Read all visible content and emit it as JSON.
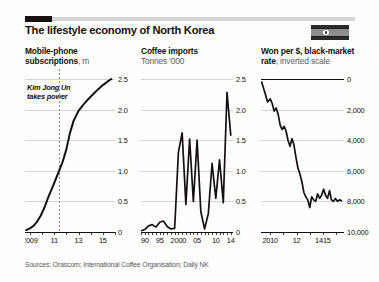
{
  "header": {
    "title": "The lifestyle economy of North Korea",
    "flag_name": "north-korea-flag"
  },
  "sources": "Sources: Orascom; International Coffee Organisation; Daily NK",
  "annotation": {
    "line1": "Kim Jong Un",
    "line2": "takes power"
  },
  "colors": {
    "ink": "#14100f",
    "grid": "#c9c9c4",
    "rule": "#d4d4d0",
    "muted": "#5c5c58",
    "line": "#16100f"
  },
  "chart_data": [
    {
      "type": "line",
      "id": "mobile-phone-subscriptions",
      "title": "Mobile-phone subscriptions",
      "title_main": "Mobile-phone",
      "title_second": "subscriptions",
      "unit": ", m",
      "ylabel": "m",
      "xlabel": "",
      "ylim": [
        0,
        2.5
      ],
      "yticks": [
        0,
        0.5,
        1.0,
        1.5,
        2.0,
        2.5
      ],
      "ytick_labels": [
        "0",
        "0.5",
        "1.0",
        "1.5",
        "2.0",
        "2.5"
      ],
      "xlim": [
        2008.6,
        2016.0
      ],
      "xticks": [
        2009,
        2010,
        2011,
        2012,
        2013,
        2014,
        2015,
        2016
      ],
      "xtick_labels": [
        "2009",
        "11",
        "13",
        "15"
      ],
      "xtick_label_values": [
        2009,
        2011,
        2013,
        2015
      ],
      "grid": true,
      "annotation_x": 2011.4,
      "annotation": "Kim Jong Un takes power",
      "x": [
        2008.7,
        2009.0,
        2009.3,
        2009.6,
        2009.9,
        2010.2,
        2010.5,
        2010.9,
        2011.3,
        2011.7,
        2012.0,
        2012.3,
        2012.6,
        2013.0,
        2013.4,
        2013.8,
        2014.2,
        2014.6,
        2015.0,
        2015.4,
        2015.7
      ],
      "values": [
        0.03,
        0.06,
        0.1,
        0.17,
        0.27,
        0.4,
        0.56,
        0.75,
        0.95,
        1.15,
        1.35,
        1.62,
        1.82,
        1.98,
        2.08,
        2.17,
        2.25,
        2.33,
        2.4,
        2.46,
        2.5
      ]
    },
    {
      "type": "line",
      "id": "coffee-imports",
      "title": "Coffee imports",
      "title_main": "Coffee imports",
      "title_second": "Tonnes '000",
      "unit": "Tonnes '000",
      "ylabel": "Tonnes '000",
      "xlabel": "",
      "ylim": [
        0,
        2.5
      ],
      "yticks": [
        0,
        0.5,
        1.0,
        1.5,
        2.0,
        2.5
      ],
      "ytick_labels": [
        "0",
        "0.5",
        "1.0",
        "1.5",
        "2.0",
        "2.5"
      ],
      "xlim": [
        1990,
        2014.6
      ],
      "xtick_labels": [
        "1990",
        "95",
        "2000",
        "05",
        "10",
        "14"
      ],
      "xtick_label_values": [
        1990,
        1995,
        2000,
        2005,
        2010,
        2014
      ],
      "grid": true,
      "x": [
        1990,
        1991,
        1992,
        1993,
        1994,
        1995,
        1996,
        1997,
        1998,
        1999,
        2000,
        2001,
        2002,
        2003,
        2004,
        2005,
        2006,
        2007,
        2008,
        2009,
        2010,
        2011,
        2012,
        2013,
        2014
      ],
      "values": [
        0.02,
        0.04,
        0.1,
        0.12,
        0.08,
        0.16,
        0.18,
        0.09,
        0.05,
        0.06,
        1.3,
        1.62,
        0.45,
        1.52,
        0.5,
        1.5,
        0.33,
        0.05,
        0.3,
        1.12,
        0.55,
        1.18,
        0.48,
        2.28,
        1.58
      ]
    },
    {
      "type": "line",
      "id": "won-per-dollar-black-market",
      "title": "Won per $, black-market rate",
      "title_main": "Won per $, black-market",
      "title_second": "rate",
      "unit": ", inverted scale",
      "ylabel": "Won per $",
      "xlabel": "",
      "inverted": true,
      "ylim": [
        0,
        10000
      ],
      "yticks": [
        0,
        2000,
        4000,
        6000,
        8000,
        10000
      ],
      "ytick_labels": [
        "0",
        "2,000",
        "4,000",
        "6,000",
        "8,000",
        "10,000"
      ],
      "xlim": [
        2009.3,
        2015.6
      ],
      "xticks": [
        2010,
        2011,
        2012,
        2013,
        2014,
        2015
      ],
      "xtick_labels": [
        "2010",
        "12",
        "1415"
      ],
      "xtick_label_values": [
        2010,
        2012,
        2014
      ],
      "grid": true,
      "x": [
        2009.35,
        2009.6,
        2009.8,
        2010.0,
        2010.15,
        2010.3,
        2010.45,
        2010.6,
        2010.75,
        2010.9,
        2011.05,
        2011.2,
        2011.35,
        2011.5,
        2011.65,
        2011.8,
        2011.95,
        2012.1,
        2012.25,
        2012.4,
        2012.55,
        2012.7,
        2012.85,
        2013.0,
        2013.15,
        2013.3,
        2013.45,
        2013.6,
        2013.75,
        2013.9,
        2014.05,
        2014.2,
        2014.35,
        2014.5,
        2014.65,
        2014.8,
        2014.95,
        2015.1,
        2015.25,
        2015.4
      ],
      "values": [
        200,
        900,
        1500,
        1300,
        1600,
        2100,
        1900,
        2300,
        3000,
        3300,
        3100,
        3400,
        4000,
        4400,
        3900,
        4300,
        5100,
        5800,
        6200,
        6700,
        7400,
        7700,
        7900,
        8400,
        7700,
        7900,
        8000,
        7500,
        7800,
        7600,
        7200,
        7600,
        7800,
        7300,
        7900,
        8000,
        7800,
        8000,
        7900,
        7950
      ]
    }
  ]
}
